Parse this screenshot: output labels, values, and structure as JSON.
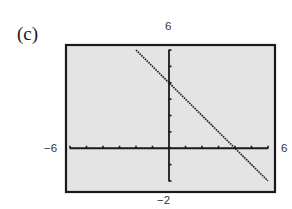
{
  "panel": {
    "label": "(c)"
  },
  "window": {
    "xmin_label": "−6",
    "xmax_label": "6",
    "ymin_label": "−2",
    "ymax_label": "6"
  },
  "colors": {
    "screen_background": "#e4e4e4",
    "frame": "#1a1a1a",
    "axes": "#1a1a1a",
    "line": "#222222"
  },
  "chart_data": {
    "type": "line",
    "title": "(c)",
    "xlabel": "",
    "ylabel": "",
    "xlim": [
      -6,
      6
    ],
    "ylim": [
      -2,
      6
    ],
    "xscale_ticks": 1,
    "yscale_ticks": 1,
    "grid": false,
    "legend": null,
    "series": [
      {
        "name": "y = -x + 4",
        "style": "dotted-pixel",
        "x": [
          -2,
          -1,
          0,
          1,
          2,
          3,
          4,
          5,
          6
        ],
        "y": [
          6,
          5,
          4,
          3,
          2,
          1,
          0,
          -1,
          -2
        ]
      }
    ],
    "intercepts": {
      "y_intercept": [
        0,
        4
      ],
      "x_intercept": [
        4,
        0
      ]
    },
    "tick_labels": {
      "x_left": "-6",
      "x_right": "6",
      "y_top": "6",
      "y_bottom": "-2"
    }
  }
}
